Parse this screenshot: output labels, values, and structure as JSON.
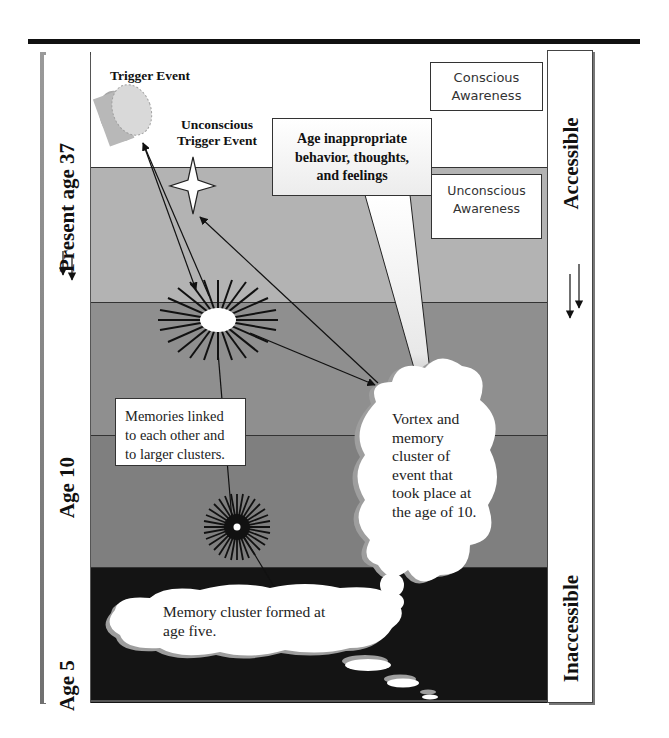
{
  "diagram": {
    "left_axis": {
      "labels": [
        {
          "text": "Present age 37",
          "arrow": "double-down-arrow"
        },
        {
          "text": "Age 10"
        },
        {
          "text": "Age 5"
        }
      ]
    },
    "right_axis": {
      "top_label": "Accessible",
      "bottom_label": "Inaccessible",
      "arrow": "double-down-arrow"
    },
    "bands": [
      {
        "name": "conscious",
        "color": "#ffffff"
      },
      {
        "name": "unconscious-light",
        "color": "#b3b3b3"
      },
      {
        "name": "memory-upper",
        "color": "#8f8f8f"
      },
      {
        "name": "memory-lower",
        "color": "#7f7f7f"
      },
      {
        "name": "inaccessible",
        "color": "#141414"
      }
    ],
    "labels": {
      "trigger_event": "Trigger Event",
      "unconscious_trigger_line1": "Unconscious",
      "unconscious_trigger_line2": "Trigger Event"
    },
    "boxes": {
      "conscious_awareness": {
        "line1": "Conscious",
        "line2": "Awareness"
      },
      "unconscious_awareness": {
        "line1": "Unconscious",
        "line2": "Awareness"
      },
      "age_inappropriate": {
        "line1": "Age inappropriate",
        "line2": "behavior, thoughts,",
        "line3": "and feelings"
      },
      "memories_linked": {
        "line1": "Memories linked",
        "line2": "to each other and",
        "line3": "to larger clusters."
      }
    },
    "clouds": {
      "vortex": {
        "lines": [
          "Vortex and",
          "memory",
          "cluster of",
          "event that",
          "took place at",
          "the age of 10."
        ]
      },
      "age_five": {
        "line1": "Memory cluster formed at",
        "line2": "age five."
      }
    }
  }
}
